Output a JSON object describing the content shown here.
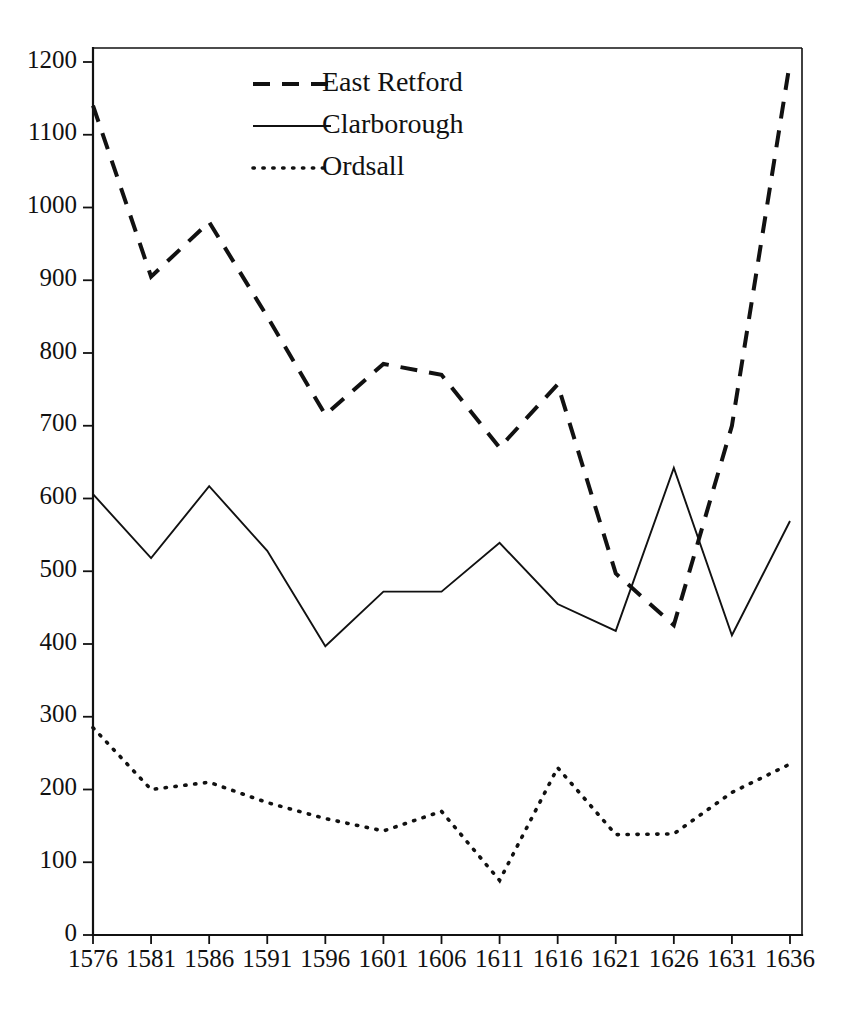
{
  "chart_data": {
    "type": "line",
    "title": "",
    "subtitle": "",
    "xlabel": "",
    "ylabel": "",
    "x": [
      1576,
      1581,
      1586,
      1591,
      1596,
      1601,
      1606,
      1611,
      1616,
      1621,
      1626,
      1631,
      1636
    ],
    "xtick_labels": [
      "1576",
      "1581",
      "1586",
      "1591",
      "1596",
      "1601",
      "1606",
      "1611",
      "1616",
      "1621",
      "1626",
      "1631",
      "1636"
    ],
    "ytick_labels": [
      "0",
      "100",
      "200",
      "300",
      "400",
      "500",
      "600",
      "700",
      "800",
      "900",
      "1000",
      "1100",
      "1200"
    ],
    "yticks": [
      0,
      100,
      200,
      300,
      400,
      500,
      600,
      700,
      800,
      900,
      1000,
      1100,
      1200
    ],
    "ylim": [
      0,
      1200
    ],
    "xlim": [
      1576,
      1636
    ],
    "grid": false,
    "legend_position": "top-center",
    "series": [
      {
        "name": "East Retford",
        "style": "dashed",
        "color": "#111111",
        "values": [
          1140,
          905,
          980,
          850,
          715,
          785,
          770,
          670,
          757,
          497,
          426,
          700,
          1200
        ]
      },
      {
        "name": "Clarborough",
        "style": "solid",
        "color": "#111111",
        "values": [
          606,
          518,
          617,
          528,
          397,
          472,
          472,
          539,
          455,
          418,
          642,
          412,
          569
        ]
      },
      {
        "name": "Ordsall",
        "style": "dotted",
        "color": "#111111",
        "values": [
          285,
          200,
          210,
          182,
          160,
          143,
          170,
          75,
          230,
          138,
          139,
          196,
          235
        ]
      }
    ]
  },
  "legend": {
    "items": [
      {
        "label": "East Retford",
        "style": "dashed"
      },
      {
        "label": "Clarborough",
        "style": "solid"
      },
      {
        "label": "Ordsall",
        "style": "dotted"
      }
    ]
  }
}
